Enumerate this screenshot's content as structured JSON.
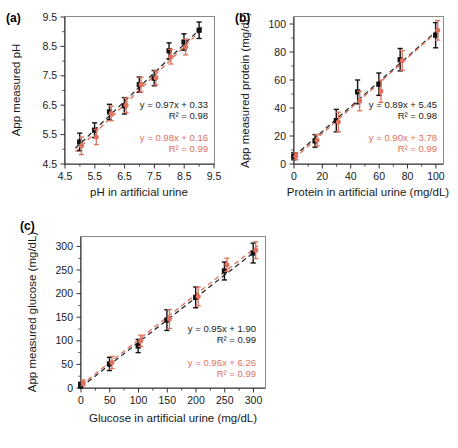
{
  "figure": {
    "panels": [
      "a",
      "b",
      "c"
    ],
    "colors": {
      "series_black": "#111111",
      "series_red": "#e0705c",
      "axis": "#333333",
      "frame": "#8a8a8a"
    }
  },
  "panel_a": {
    "tag": "(a)",
    "chart_data": {
      "type": "scatter",
      "title": "",
      "xlabel": "pH in artificial urine",
      "ylabel": "App measured pH",
      "xlim": [
        4.5,
        9.5
      ],
      "ylim": [
        4.5,
        9.5
      ],
      "xticks": [
        "4.5",
        "5.5",
        "6.5",
        "7.5",
        "8.5",
        "9.5"
      ],
      "yticks": [
        "4.5",
        "5.5",
        "6.5",
        "7.5",
        "8.5",
        "9.5"
      ],
      "grid": false,
      "legend": "none",
      "x": [
        5.0,
        5.5,
        6.0,
        6.5,
        7.0,
        7.5,
        8.0,
        8.5
      ],
      "series": [
        {
          "name": "black",
          "color": "#111111",
          "values": [
            5.25,
            5.65,
            6.27,
            6.48,
            7.2,
            7.42,
            8.35,
            8.65
          ],
          "errors": [
            0.3,
            0.25,
            0.26,
            0.28,
            0.26,
            0.26,
            0.27,
            0.28
          ]
        },
        {
          "name": "red",
          "color": "#e0705c",
          "values": [
            5.12,
            5.42,
            6.22,
            6.5,
            7.2,
            7.43,
            8.15,
            8.48
          ],
          "errors": [
            0.3,
            0.26,
            0.25,
            0.25,
            0.25,
            0.24,
            0.25,
            0.27
          ]
        }
      ],
      "extra_point": {
        "x": 9.0,
        "y": 9.05,
        "error": 0.28
      },
      "annotations": [
        {
          "text": "y = 0.97x + 0.33",
          "color": "#111111"
        },
        {
          "text": "R² = 0.98",
          "color": "#111111"
        },
        {
          "text": "y = 0.98x + 0.16",
          "color": "#e0705c"
        },
        {
          "text": "R² = 0.99",
          "color": "#e0705c"
        }
      ],
      "fits": [
        {
          "name": "black",
          "slope": 0.97,
          "intercept": 0.33,
          "r2": 0.98
        },
        {
          "name": "red",
          "slope": 0.98,
          "intercept": 0.16,
          "r2": 0.99
        }
      ]
    }
  },
  "panel_b": {
    "tag": "(b)",
    "chart_data": {
      "type": "scatter",
      "title": "",
      "xlabel": "Protein in artificial urine (mg/dL)",
      "ylabel": "App measured protein (mg/dL)",
      "xlim": [
        0,
        105
      ],
      "ylim": [
        0,
        105
      ],
      "xticks": [
        "0",
        "20",
        "40",
        "60",
        "80",
        "100"
      ],
      "yticks": [
        "0",
        "20",
        "40",
        "60",
        "80",
        "100"
      ],
      "grid": false,
      "legend": "none",
      "x": [
        0,
        15,
        30,
        45,
        60,
        75,
        100
      ],
      "series": [
        {
          "name": "black",
          "color": "#111111",
          "values": [
            5.5,
            16.5,
            31,
            51.5,
            57,
            74.5,
            92
          ],
          "errors": [
            2.5,
            4.5,
            8,
            8.5,
            8,
            8,
            9
          ]
        },
        {
          "name": "red",
          "color": "#e0705c",
          "values": [
            5.5,
            17,
            30,
            45,
            52,
            74,
            95.5
          ],
          "errors": [
            2.5,
            4,
            7,
            7,
            8,
            7,
            7
          ]
        }
      ],
      "annotations": [
        {
          "text": "y = 0.89x + 5.45",
          "color": "#111111"
        },
        {
          "text": "R² = 0.98",
          "color": "#111111"
        },
        {
          "text": "y = 0.90x + 3.78",
          "color": "#e0705c"
        },
        {
          "text": "R² = 0.99",
          "color": "#e0705c"
        }
      ],
      "fits": [
        {
          "name": "black",
          "slope": 0.89,
          "intercept": 5.45,
          "r2": 0.98
        },
        {
          "name": "red",
          "slope": 0.9,
          "intercept": 3.78,
          "r2": 0.99
        }
      ]
    }
  },
  "panel_c": {
    "tag": "(c)",
    "chart_data": {
      "type": "scatter",
      "title": "",
      "xlabel": "Glucose in artificial urine (mg/dL)",
      "ylabel": "App measured glucose (mg/dL)",
      "xlim": [
        0,
        320
      ],
      "ylim": [
        0,
        320
      ],
      "xticks": [
        "0",
        "50",
        "100",
        "150",
        "200",
        "250",
        "300"
      ],
      "yticks": [
        "0",
        "50",
        "100",
        "150",
        "200",
        "250",
        "300"
      ],
      "grid": false,
      "legend": "none",
      "x": [
        0,
        50,
        100,
        150,
        200,
        250,
        300
      ],
      "series": [
        {
          "name": "black",
          "color": "#111111",
          "values": [
            6,
            51,
            89,
            144,
            192,
            248,
            286
          ],
          "errors": [
            6,
            14,
            14,
            22,
            22,
            19,
            21
          ]
        },
        {
          "name": "red",
          "color": "#e0705c",
          "values": [
            11,
            54,
            100,
            146,
            194,
            261,
            292
          ],
          "errors": [
            6,
            13,
            12,
            20,
            20,
            14,
            18
          ]
        }
      ],
      "annotations": [
        {
          "text": "y = 0.95x + 1.90",
          "color": "#111111"
        },
        {
          "text": "R² = 0.99",
          "color": "#111111"
        },
        {
          "text": "y = 0.96x + 6.26",
          "color": "#e0705c"
        },
        {
          "text": "R² = 0.99",
          "color": "#e0705c"
        }
      ],
      "fits": [
        {
          "name": "black",
          "slope": 0.95,
          "intercept": 1.9,
          "r2": 0.99
        },
        {
          "name": "red",
          "slope": 0.96,
          "intercept": 6.26,
          "r2": 0.99
        }
      ]
    }
  }
}
